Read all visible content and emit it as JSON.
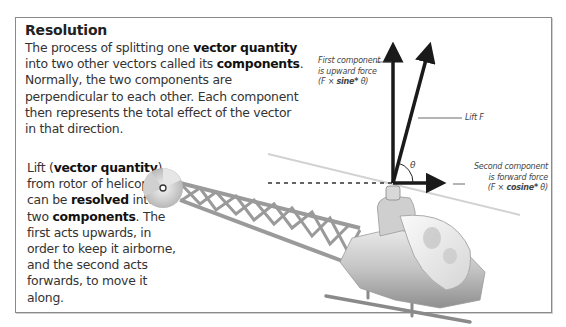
{
  "panel": {
    "title": "Resolution",
    "definition": {
      "p1": "The process of splitting one ",
      "b1": "vector quantity",
      "p2": " into two other vectors called its ",
      "b2": "components",
      "p3": ". Normally, the two components are perpendicular to each other. Each component then represents the total effect of the vector in that direction."
    },
    "example": {
      "p1": "Lift (",
      "b1": "vector quantity",
      "p2": ") from rotor of helicopter can be ",
      "b2": "resolved",
      "p3": " into two ",
      "b3": "components",
      "p4": ". The first acts upwards, in order to keep it airborne, and the second acts forwards, to move it along."
    }
  },
  "diagram": {
    "labels": {
      "first_component": {
        "line1": "First component",
        "line2": "is upward force",
        "formula_pre": "(F × ",
        "formula_bold": "sine*",
        "formula_post": " θ)"
      },
      "lift": "Lift F",
      "angle": "θ",
      "second_component": {
        "line1": "Second component",
        "line2": "is forward force",
        "formula_pre": "(F × ",
        "formula_bold": "cosine*",
        "formula_post": " θ)"
      }
    },
    "vectors": [
      {
        "name": "upward-component",
        "from": [
          393,
          183
        ],
        "to": [
          393,
          45
        ]
      },
      {
        "name": "lift-resultant",
        "from": [
          393,
          183
        ],
        "to": [
          430,
          45
        ]
      },
      {
        "name": "forward-component",
        "from": [
          393,
          183
        ],
        "to": [
          443,
          183
        ]
      }
    ],
    "colors": {
      "arrow": "#1a1a1a",
      "frame": "#8a8a8a",
      "body": "#bdbdbd"
    }
  }
}
